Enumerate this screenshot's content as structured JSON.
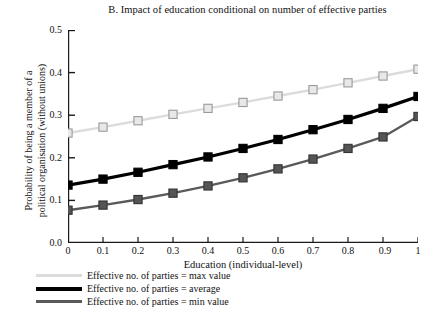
{
  "chart_data": {
    "type": "line",
    "title": "B. Impact of education conditional on number of effective parties",
    "xlabel": "Education (individual-level)",
    "ylabel_line1": "Probability of being a member of a",
    "ylabel_line2": "political organisation (without unions)",
    "x": [
      0,
      0.1,
      0.2,
      0.3,
      0.4,
      0.5,
      0.6,
      0.7,
      0.8,
      0.9,
      1
    ],
    "xticklabels": [
      "0",
      "0.1",
      "0.2",
      "0.3",
      "0.4",
      "0.5",
      "0.6",
      "0.7",
      "0.8",
      "0.9",
      "1"
    ],
    "yticklabels": [
      "0.0",
      "0.1",
      "0.2",
      "0.3",
      "0.4",
      "0.5"
    ],
    "yticks": [
      0.0,
      0.1,
      0.2,
      0.3,
      0.4,
      0.5
    ],
    "xlim": [
      0,
      1
    ],
    "ylim": [
      0.0,
      0.5
    ],
    "grid": false,
    "legend_position": "below-plot-left",
    "marker": "square",
    "series": [
      {
        "name": "Effective no. of parties = max value",
        "color": "#dcdcdc",
        "marker_fill": "#e8e8e8",
        "marker_edge": "#9a9a9a",
        "values": [
          0.258,
          0.272,
          0.287,
          0.302,
          0.316,
          0.33,
          0.345,
          0.36,
          0.376,
          0.392,
          0.408
        ]
      },
      {
        "name": "Effective no. of parties = average",
        "color": "#000000",
        "marker_fill": "#000000",
        "marker_edge": "#000000",
        "values": [
          0.136,
          0.15,
          0.166,
          0.184,
          0.202,
          0.222,
          0.243,
          0.266,
          0.29,
          0.316,
          0.344
        ]
      },
      {
        "name": "Effective no. of parties = min value",
        "color": "#5a5a5a",
        "marker_fill": "#555555",
        "marker_edge": "#333333",
        "values": [
          0.077,
          0.089,
          0.102,
          0.117,
          0.134,
          0.153,
          0.174,
          0.197,
          0.222,
          0.249,
          0.297
        ]
      }
    ]
  },
  "legend": {
    "items": [
      {
        "label": "Effective no. of parties = max value"
      },
      {
        "label": "Effective no. of parties = average"
      },
      {
        "label": "Effective no. of parties = min value"
      }
    ]
  }
}
